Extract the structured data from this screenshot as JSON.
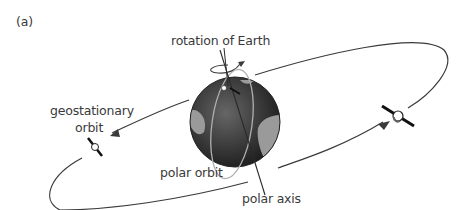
{
  "figure": {
    "panel_label": "(a)",
    "labels": {
      "rotation": "rotation of Earth",
      "geostationary_line1": "geostationary",
      "geostationary_line2": "orbit",
      "polar_orbit": "polar orbit",
      "polar_axis": "polar axis"
    },
    "icons": [
      "earth-globe-icon",
      "satellite-icon",
      "satellite-icon",
      "rotation-arrow-icon"
    ],
    "colors": {
      "line": "#3a3a3a",
      "globe_dark": "#2b2b2b",
      "globe_land": "#9a9a9a",
      "polar_orbit": "#b0b0b0"
    }
  }
}
